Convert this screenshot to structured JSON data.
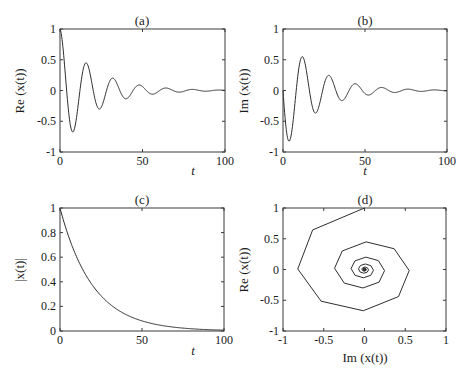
{
  "figure": {
    "background": "#ffffff",
    "line_color": "#2e2e2e"
  },
  "chart_data": [
    {
      "id": "a",
      "type": "line",
      "title": "(a)",
      "xlabel": "t",
      "ylabel": "Re (x(t))",
      "xlim": [
        0,
        100
      ],
      "ylim": [
        -1,
        1
      ],
      "xticks": [
        0,
        50,
        100
      ],
      "xtick_labels": [
        "0",
        "50",
        "100"
      ],
      "yticks": [
        -1,
        -0.5,
        0,
        0.5,
        1
      ],
      "ytick_labels": [
        "-1",
        "-0.5",
        "0",
        "0.5",
        "1"
      ],
      "grid": false,
      "frame_px": {
        "left": 60,
        "top": 29,
        "right": 225,
        "bottom": 152
      },
      "series": [
        {
          "name": "Re x(t)",
          "function": "exp(-0.05 t) cos(0.39 t)",
          "x": [
            0,
            6.5,
            16,
            24,
            32,
            40,
            48,
            56,
            64,
            72,
            80,
            88,
            100
          ],
          "y": [
            1.0,
            -0.66,
            0.44,
            -0.3,
            0.19,
            -0.13,
            0.09,
            -0.06,
            0.04,
            -0.03,
            0.02,
            -0.01,
            0.0
          ]
        }
      ]
    },
    {
      "id": "b",
      "type": "line",
      "title": "(b)",
      "xlabel": "t",
      "ylabel": "Im (x(t))",
      "xlim": [
        0,
        100
      ],
      "ylim": [
        -1,
        1
      ],
      "xticks": [
        0,
        50,
        100
      ],
      "xtick_labels": [
        "0",
        "50",
        "100"
      ],
      "yticks": [
        -1,
        -0.5,
        0,
        0.5,
        1
      ],
      "ytick_labels": [
        "-1",
        "-0.5",
        "0",
        "0.5",
        "1"
      ],
      "grid": false,
      "frame_px": {
        "left": 283,
        "top": 29,
        "right": 447,
        "bottom": 152
      },
      "series": [
        {
          "name": "Im x(t)",
          "function": "-exp(-0.05 t) sin(0.39 t)",
          "x": [
            0,
            4,
            12,
            20,
            28,
            36,
            44,
            52,
            60,
            68,
            76,
            84,
            100
          ],
          "y": [
            0.0,
            -0.82,
            0.55,
            -0.37,
            0.25,
            -0.17,
            0.11,
            -0.07,
            0.05,
            -0.03,
            0.02,
            -0.01,
            0.0
          ]
        }
      ]
    },
    {
      "id": "c",
      "type": "line",
      "title": "(c)",
      "xlabel": "t",
      "ylabel": "|x(t)|",
      "xlim": [
        0,
        100
      ],
      "ylim": [
        0,
        1
      ],
      "xticks": [
        0,
        50,
        100
      ],
      "xtick_labels": [
        "0",
        "50",
        "100"
      ],
      "yticks": [
        0,
        0.2,
        0.4,
        0.6,
        0.8,
        1
      ],
      "ytick_labels": [
        "0",
        "0.2",
        "0.4",
        "0.6",
        "0.8",
        "1"
      ],
      "grid": false,
      "frame_px": {
        "left": 60,
        "top": 208,
        "right": 224,
        "bottom": 331
      },
      "series": [
        {
          "name": "|x(t)|",
          "function": "exp(-0.05 t)",
          "x": [
            0,
            10,
            20,
            30,
            40,
            50,
            60,
            70,
            80,
            90,
            100
          ],
          "y": [
            1.0,
            0.61,
            0.37,
            0.22,
            0.14,
            0.08,
            0.05,
            0.03,
            0.02,
            0.01,
            0.007
          ]
        }
      ]
    },
    {
      "id": "d",
      "type": "line",
      "title": "(d)",
      "xlabel": "Im (x(t))",
      "ylabel": "Re (x(t))",
      "xlim": [
        -1,
        1
      ],
      "ylim": [
        -1,
        1
      ],
      "xticks": [
        -1,
        -0.5,
        0,
        0.5,
        1
      ],
      "xtick_labels": [
        "-1",
        "-0.5",
        "0",
        "0.5",
        "1"
      ],
      "yticks": [
        -1,
        -0.5,
        0,
        0.5,
        1
      ],
      "ytick_labels": [
        "-1",
        "-0.5",
        "0",
        "0.5",
        "1"
      ],
      "grid": false,
      "frame_px": {
        "left": 283,
        "top": 208,
        "right": 446,
        "bottom": 331
      },
      "series": [
        {
          "name": "phase-plane spiral",
          "function": "x = -exp(-0.05 t) sin(0.39 t), y = exp(-0.05 t) cos(0.39 t), t in [0,100], sampled every 2",
          "t_start": 0,
          "t_end": 100,
          "t_step": 2,
          "decay": 0.05,
          "omega": 0.39
        }
      ]
    }
  ]
}
